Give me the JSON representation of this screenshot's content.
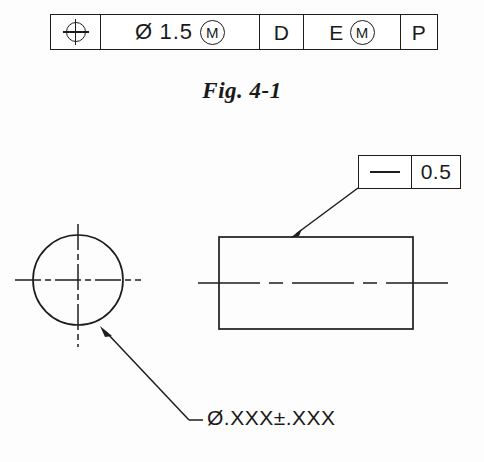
{
  "figure": {
    "caption": "Fig. 4-1",
    "background_color": "#fdfdfd",
    "line_color": "#1d1d1d"
  },
  "feature_control_frame": {
    "name": "position-feature-control-frame",
    "cells": [
      {
        "type": "geometric-characteristic",
        "symbol_name": "position-symbol",
        "label": ""
      },
      {
        "type": "tolerance",
        "diameter_symbol": "Ø",
        "value": "1.5",
        "modifier": "M"
      },
      {
        "type": "primary-datum",
        "label": "D"
      },
      {
        "type": "secondary-datum",
        "label": "E",
        "modifier": "M"
      },
      {
        "type": "tertiary-datum",
        "label": "P"
      }
    ]
  },
  "straightness_callout": {
    "name": "straightness-feature-control-frame",
    "symbol_name": "straightness-symbol",
    "tolerance": "0.5"
  },
  "dimension_note": {
    "text": "Ø.XXX±.XXX"
  },
  "views": {
    "end_view": {
      "name": "circular-end-view",
      "shape": "circle",
      "center": [
        78,
        280
      ],
      "radius": 45
    },
    "side_view": {
      "name": "rectangular-side-view",
      "shape": "rectangle",
      "left": 219,
      "top": 237,
      "right": 413,
      "bottom": 329
    }
  },
  "leaders": {
    "straightness_leader": {
      "name": "straightness-leader-line",
      "from": [
        360,
        189
      ],
      "to": [
        291,
        237
      ]
    },
    "diameter_leader": {
      "name": "diameter-leader-line",
      "from": [
        101,
        327
      ],
      "elbow": [
        189,
        420
      ],
      "to": [
        202,
        420
      ]
    }
  }
}
